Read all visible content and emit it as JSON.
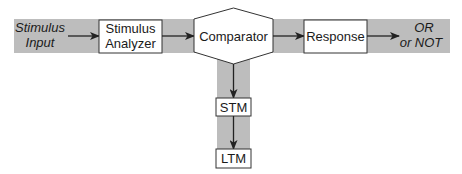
{
  "diagram": {
    "type": "flowchart",
    "colors": {
      "band": "#bdbdbd",
      "box_fill": "#ffffff",
      "stroke": "#333333",
      "text": "#1a1a1a"
    },
    "nodes": {
      "input": {
        "line1": "Stimulus",
        "line2": "Input"
      },
      "analyzer": {
        "line1": "Stimulus",
        "line2": "Analyzer"
      },
      "comparator": {
        "label": "Comparator"
      },
      "response": {
        "label": "Response"
      },
      "output": {
        "line1": "OR",
        "line2": "or NOT"
      },
      "stm": {
        "label": "STM"
      },
      "ltm": {
        "label": "LTM"
      }
    },
    "edges": [
      {
        "from": "Stimulus Input",
        "to": "Stimulus Analyzer"
      },
      {
        "from": "Stimulus Analyzer",
        "to": "Comparator"
      },
      {
        "from": "Comparator",
        "to": "Response"
      },
      {
        "from": "Response",
        "to": "OR or NOT"
      },
      {
        "from": "Comparator",
        "to": "STM"
      },
      {
        "from": "STM",
        "to": "LTM"
      }
    ]
  }
}
